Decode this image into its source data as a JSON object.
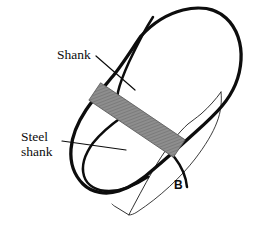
{
  "figure": {
    "panel_letter": "B",
    "width": 258,
    "height": 228,
    "background_color": "#ffffff",
    "ink_color": "#0d0d0d",
    "shank_fill_color": "#8c8c8c",
    "shank_hatch_color": "#6e6e6e",
    "thin_line_color": "#1a1a1a"
  },
  "labels": {
    "shank": "Shank",
    "steel_line1": "Steel",
    "steel_line2": "shank",
    "panel_b": "B"
  },
  "parts": [
    {
      "name": "sole-outline",
      "description": "Thick black outline of the shoe sole / insole, toe at upper right, heel at lower left",
      "stroke_width": 3.2,
      "style": "thick-closed-curve"
    },
    {
      "name": "inner-sole-curve",
      "description": "Thick inner contour following the waist of the sole",
      "stroke_width": 2.6,
      "style": "thick-open-curve"
    },
    {
      "name": "heel-wedge-outline",
      "description": "Thin line outlining the heel wedge extending to lower right",
      "stroke_width": 0.9,
      "style": "thin-open-polyline"
    },
    {
      "name": "steel-shank",
      "description": "Hatched grey elongated rectangle lying diagonally along the sole waist",
      "fill": "#8c8c8c",
      "angle_degrees": -55
    }
  ],
  "leader_lines": [
    {
      "name": "shank-leader",
      "from_label": "Shank",
      "x1": 96,
      "y1": 57,
      "x2": 134,
      "y2": 89
    },
    {
      "name": "steel-shank-leader",
      "from_label": "Steel shank",
      "x1": 63,
      "y1": 142,
      "x2": 124,
      "y2": 150
    }
  ]
}
